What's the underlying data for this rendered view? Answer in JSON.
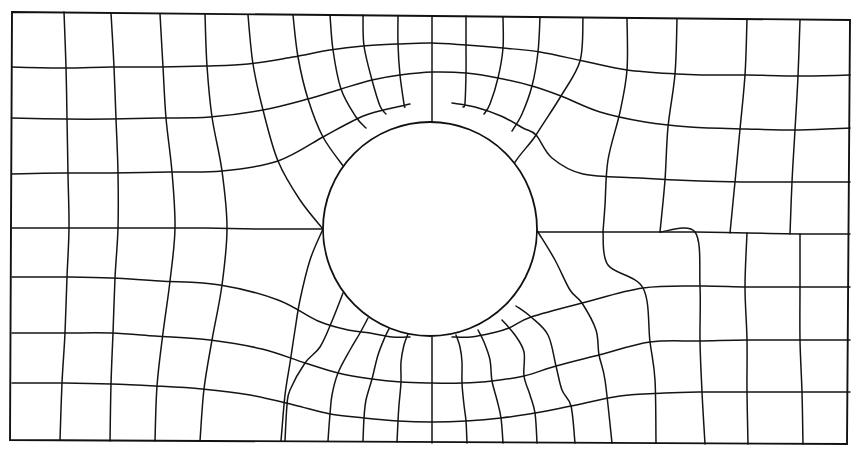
{
  "diagram": {
    "type": "finite-element-mesh",
    "colors": {
      "line": "#141414",
      "background": "#ffffff"
    },
    "border": {
      "points": [
        [
          12,
          12
        ],
        [
          850,
          20
        ],
        [
          847,
          444
        ],
        [
          10,
          440
        ]
      ]
    },
    "hole": {
      "cx": 430,
      "cy": 229,
      "r": 107
    },
    "horizontal_lines": [
      [
        [
          12,
          67
        ],
        [
          64,
          68
        ],
        [
          111,
          67
        ],
        [
          160,
          67
        ],
        [
          205,
          66
        ],
        [
          248,
          64
        ],
        [
          293,
          57
        ],
        [
          330,
          50
        ],
        [
          363,
          46
        ],
        [
          398,
          44
        ],
        [
          432,
          43
        ],
        [
          466,
          45
        ],
        [
          503,
          48
        ],
        [
          540,
          52
        ],
        [
          583,
          61
        ],
        [
          627,
          70
        ],
        [
          677,
          74
        ],
        [
          704,
          75
        ],
        [
          747,
          75
        ],
        [
          800,
          76
        ],
        [
          850,
          75
        ]
      ],
      [
        [
          12,
          118
        ],
        [
          64,
          119
        ],
        [
          111,
          119
        ],
        [
          160,
          118
        ],
        [
          210,
          117
        ],
        [
          263,
          110
        ],
        [
          308,
          99
        ],
        [
          341,
          89
        ],
        [
          372,
          80
        ],
        [
          400,
          75
        ],
        [
          432,
          72
        ],
        [
          466,
          73
        ],
        [
          498,
          78
        ],
        [
          532,
          86
        ],
        [
          561,
          96
        ],
        [
          600,
          112
        ],
        [
          645,
          122
        ],
        [
          690,
          127
        ],
        [
          747,
          129
        ],
        [
          800,
          130
        ],
        [
          850,
          128
        ]
      ],
      [
        [
          12,
          174
        ],
        [
          64,
          173
        ],
        [
          111,
          173
        ],
        [
          170,
          172
        ],
        [
          222,
          171
        ],
        [
          278,
          161
        ],
        [
          323,
          137
        ],
        [
          345,
          125
        ],
        [
          366,
          115
        ],
        [
          392,
          108
        ],
        [
          410,
          104
        ]
      ],
      [
        [
          452,
          103
        ],
        [
          475,
          107
        ],
        [
          501,
          116
        ],
        [
          523,
          128
        ],
        [
          536,
          135
        ],
        [
          552,
          158
        ],
        [
          583,
          174
        ],
        [
          640,
          178
        ],
        [
          700,
          181
        ],
        [
          747,
          182
        ],
        [
          800,
          182
        ],
        [
          850,
          182
        ]
      ],
      [
        [
          12,
          228
        ],
        [
          64,
          228
        ],
        [
          111,
          228
        ],
        [
          160,
          228
        ],
        [
          205,
          228
        ],
        [
          260,
          229
        ],
        [
          323,
          229
        ]
      ],
      [
        [
          538,
          232
        ],
        [
          583,
          232
        ],
        [
          640,
          232
        ],
        [
          695,
          232
        ],
        [
          747,
          233
        ],
        [
          800,
          234
        ],
        [
          850,
          234
        ]
      ],
      [
        [
          12,
          277
        ],
        [
          64,
          277
        ],
        [
          111,
          278
        ],
        [
          160,
          281
        ],
        [
          220,
          285
        ],
        [
          278,
          300
        ],
        [
          318,
          321
        ],
        [
          348,
          330
        ],
        [
          370,
          333
        ],
        [
          392,
          337
        ],
        [
          410,
          337
        ]
      ],
      [
        [
          452,
          337
        ],
        [
          471,
          337
        ],
        [
          492,
          333
        ],
        [
          509,
          328
        ],
        [
          531,
          317
        ],
        [
          582,
          303
        ],
        [
          643,
          288
        ],
        [
          700,
          286
        ],
        [
          747,
          287
        ],
        [
          800,
          287
        ],
        [
          850,
          287
        ]
      ],
      [
        [
          12,
          333
        ],
        [
          64,
          333
        ],
        [
          111,
          333
        ],
        [
          155,
          336
        ],
        [
          210,
          340
        ],
        [
          262,
          349
        ],
        [
          305,
          363
        ],
        [
          338,
          373
        ],
        [
          372,
          379
        ],
        [
          401,
          382
        ],
        [
          432,
          383
        ],
        [
          462,
          383
        ],
        [
          492,
          381
        ],
        [
          524,
          376
        ],
        [
          556,
          366
        ],
        [
          599,
          355
        ],
        [
          650,
          342
        ],
        [
          700,
          341
        ],
        [
          747,
          340
        ],
        [
          800,
          340
        ],
        [
          850,
          340
        ]
      ],
      [
        [
          12,
          383
        ],
        [
          64,
          383
        ],
        [
          111,
          384
        ],
        [
          155,
          386
        ],
        [
          202,
          389
        ],
        [
          250,
          395
        ],
        [
          294,
          405
        ],
        [
          330,
          414
        ],
        [
          364,
          418
        ],
        [
          398,
          421
        ],
        [
          432,
          422
        ],
        [
          466,
          421
        ],
        [
          501,
          418
        ],
        [
          535,
          413
        ],
        [
          571,
          406
        ],
        [
          620,
          396
        ],
        [
          665,
          393
        ],
        [
          700,
          392
        ],
        [
          747,
          392
        ],
        [
          800,
          392
        ],
        [
          850,
          392
        ]
      ]
    ],
    "vertical_lines": [
      [
        [
          64,
          12
        ],
        [
          66,
          67
        ],
        [
          67,
          118
        ],
        [
          68,
          174
        ],
        [
          69,
          228
        ],
        [
          67,
          277
        ],
        [
          65,
          333
        ],
        [
          62,
          383
        ],
        [
          60,
          440
        ]
      ],
      [
        [
          111,
          13
        ],
        [
          114,
          67
        ],
        [
          116,
          119
        ],
        [
          118,
          173
        ],
        [
          118,
          228
        ],
        [
          115,
          278
        ],
        [
          113,
          333
        ],
        [
          111,
          384
        ],
        [
          110,
          441
        ]
      ],
      [
        [
          160,
          14
        ],
        [
          163,
          67
        ],
        [
          166,
          118
        ],
        [
          172,
          172
        ],
        [
          175,
          228
        ],
        [
          170,
          281
        ],
        [
          163,
          333
        ],
        [
          157,
          386
        ],
        [
          155,
          441
        ]
      ],
      [
        [
          205,
          14
        ],
        [
          207,
          66
        ],
        [
          212,
          117
        ],
        [
          222,
          171
        ],
        [
          227,
          228
        ],
        [
          222,
          285
        ],
        [
          212,
          340
        ],
        [
          204,
          389
        ],
        [
          200,
          441
        ]
      ],
      [
        [
          248,
          15
        ],
        [
          253,
          64
        ],
        [
          263,
          110
        ],
        [
          278,
          161
        ],
        [
          300,
          200
        ],
        [
          323,
          229
        ]
      ],
      [
        [
          293,
          15
        ],
        [
          298,
          57
        ],
        [
          308,
          99
        ],
        [
          323,
          137
        ],
        [
          344,
          167
        ]
      ],
      [
        [
          330,
          15
        ],
        [
          333,
          50
        ],
        [
          341,
          89
        ],
        [
          356,
          117
        ],
        [
          366,
          128
        ]
      ],
      [
        [
          363,
          15
        ],
        [
          364,
          46
        ],
        [
          372,
          80
        ],
        [
          380,
          106
        ],
        [
          386,
          114
        ]
      ],
      [
        [
          398,
          16
        ],
        [
          398,
          44
        ],
        [
          400,
          75
        ],
        [
          404,
          104
        ],
        [
          405,
          107
        ]
      ],
      [
        [
          432,
          16
        ],
        [
          432,
          43
        ],
        [
          432,
          72
        ],
        [
          432,
          104
        ],
        [
          432,
          122
        ]
      ],
      [
        [
          466,
          16
        ],
        [
          466,
          45
        ],
        [
          466,
          73
        ],
        [
          465,
          103
        ],
        [
          463,
          107
        ]
      ],
      [
        [
          503,
          17
        ],
        [
          503,
          48
        ],
        [
          498,
          78
        ],
        [
          490,
          104
        ],
        [
          484,
          114
        ]
      ],
      [
        [
          540,
          17
        ],
        [
          538,
          52
        ],
        [
          532,
          86
        ],
        [
          522,
          114
        ],
        [
          512,
          131
        ]
      ],
      [
        [
          583,
          18
        ],
        [
          580,
          61
        ],
        [
          561,
          96
        ],
        [
          536,
          135
        ],
        [
          510,
          178
        ],
        [
          538,
          232
        ]
      ],
      [
        [
          627,
          18
        ],
        [
          627,
          70
        ],
        [
          620,
          112
        ],
        [
          608,
          160
        ],
        [
          605,
          205
        ],
        [
          603,
          232
        ]
      ],
      [
        [
          677,
          19
        ],
        [
          675,
          74
        ],
        [
          668,
          127
        ],
        [
          665,
          180
        ],
        [
          660,
          232
        ]
      ],
      [
        [
          747,
          19
        ],
        [
          745,
          75
        ],
        [
          740,
          129
        ],
        [
          735,
          182
        ],
        [
          730,
          233
        ]
      ],
      [
        [
          800,
          20
        ],
        [
          798,
          76
        ],
        [
          795,
          130
        ],
        [
          792,
          182
        ],
        [
          790,
          234
        ]
      ],
      [
        [
          323,
          229
        ],
        [
          310,
          260
        ],
        [
          300,
          300
        ],
        [
          295,
          330
        ],
        [
          290,
          363
        ],
        [
          285,
          395
        ],
        [
          281,
          441
        ]
      ],
      [
        [
          343,
          293
        ],
        [
          332,
          321
        ],
        [
          320,
          347
        ],
        [
          305,
          363
        ],
        [
          290,
          390
        ],
        [
          287,
          405
        ],
        [
          285,
          441
        ]
      ],
      [
        [
          368,
          318
        ],
        [
          360,
          333
        ],
        [
          350,
          350
        ],
        [
          338,
          373
        ],
        [
          332,
          395
        ],
        [
          330,
          414
        ],
        [
          328,
          441
        ]
      ],
      [
        [
          390,
          327
        ],
        [
          385,
          337
        ],
        [
          378,
          355
        ],
        [
          372,
          379
        ],
        [
          366,
          400
        ],
        [
          364,
          418
        ],
        [
          363,
          441
        ]
      ],
      [
        [
          408,
          334
        ],
        [
          404,
          345
        ],
        [
          401,
          362
        ],
        [
          401,
          382
        ],
        [
          399,
          405
        ],
        [
          398,
          421
        ],
        [
          397,
          442
        ]
      ],
      [
        [
          432,
          337
        ],
        [
          432,
          355
        ],
        [
          432,
          368
        ],
        [
          432,
          383
        ],
        [
          432,
          405
        ],
        [
          432,
          422
        ],
        [
          432,
          443
        ]
      ],
      [
        [
          456,
          335
        ],
        [
          460,
          347
        ],
        [
          462,
          362
        ],
        [
          462,
          383
        ],
        [
          464,
          405
        ],
        [
          466,
          421
        ],
        [
          467,
          443
        ]
      ],
      [
        [
          478,
          330
        ],
        [
          484,
          342
        ],
        [
          490,
          360
        ],
        [
          492,
          381
        ],
        [
          497,
          400
        ],
        [
          501,
          418
        ],
        [
          503,
          443
        ]
      ],
      [
        [
          502,
          320
        ],
        [
          515,
          335
        ],
        [
          524,
          352
        ],
        [
          524,
          376
        ],
        [
          530,
          395
        ],
        [
          535,
          413
        ],
        [
          537,
          443
        ]
      ],
      [
        [
          516,
          306
        ],
        [
          531,
          317
        ],
        [
          548,
          335
        ],
        [
          556,
          366
        ],
        [
          562,
          390
        ],
        [
          571,
          406
        ],
        [
          575,
          443
        ]
      ],
      [
        [
          538,
          232
        ],
        [
          555,
          260
        ],
        [
          570,
          290
        ],
        [
          582,
          303
        ],
        [
          596,
          330
        ],
        [
          599,
          355
        ],
        [
          605,
          380
        ],
        [
          612,
          443
        ]
      ],
      [
        [
          603,
          232
        ],
        [
          608,
          265
        ],
        [
          643,
          288
        ],
        [
          650,
          342
        ],
        [
          655,
          380
        ],
        [
          656,
          443
        ]
      ],
      [
        [
          660,
          232
        ],
        [
          695,
          232
        ],
        [
          700,
          286
        ],
        [
          700,
          341
        ],
        [
          702,
          392
        ],
        [
          705,
          444
        ]
      ],
      [
        [
          747,
          233
        ],
        [
          745,
          287
        ],
        [
          747,
          340
        ],
        [
          747,
          392
        ],
        [
          748,
          444
        ]
      ],
      [
        [
          800,
          234
        ],
        [
          800,
          287
        ],
        [
          800,
          340
        ],
        [
          802,
          392
        ],
        [
          803,
          444
        ]
      ]
    ]
  }
}
